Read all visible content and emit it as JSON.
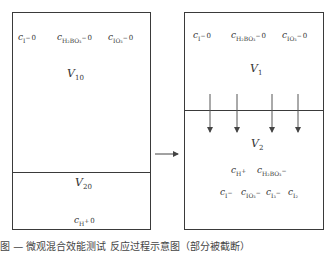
{
  "left_box": {
    "top_labels": [
      {
        "c": "c",
        "sub": "I",
        "sup": "−",
        "tail": "0"
      },
      {
        "c": "c",
        "sub": "H₂BO₃",
        "sup": "−",
        "tail": "0"
      },
      {
        "c": "c",
        "sub": "IO₃",
        "sup": "−",
        "tail": "0"
      }
    ],
    "volume_top": {
      "v": "V",
      "sub": "10"
    },
    "volume_bottom": {
      "v": "V",
      "sub": "20"
    },
    "bottom_label": {
      "c": "c",
      "sub": "H",
      "sup": "+",
      "tail": "0"
    }
  },
  "right_box": {
    "top_labels": [
      {
        "c": "c",
        "sub": "I",
        "sup": "−",
        "tail": "0"
      },
      {
        "c": "c",
        "sub": "H₂BO₃",
        "sup": "−",
        "tail": "0"
      },
      {
        "c": "c",
        "sub": "IO₃",
        "sup": "−",
        "tail": "0"
      }
    ],
    "volume_top": {
      "v": "V",
      "sub": "1"
    },
    "volume_bottom": {
      "v": "V",
      "sub": "2"
    },
    "row1": [
      {
        "c": "c",
        "sub": "H",
        "sup": "+"
      },
      {
        "c": "c",
        "sub": "H₂BO₃",
        "sup": "−"
      }
    ],
    "row2": [
      {
        "c": "c",
        "sub": "I",
        "sup": "−"
      },
      {
        "c": "c",
        "sub": "IO₃",
        "sup": "−"
      },
      {
        "c": "c",
        "sub": "I₃",
        "sup": "−"
      },
      {
        "c": "c",
        "sub": "I₂",
        "sup": ""
      }
    ]
  },
  "caption": "图 — 微观混合效能测试 反应过程示意图（部分被截断）",
  "colors": {
    "line": "#3a3a3a",
    "text": "#333333",
    "arrow": "#444444"
  }
}
